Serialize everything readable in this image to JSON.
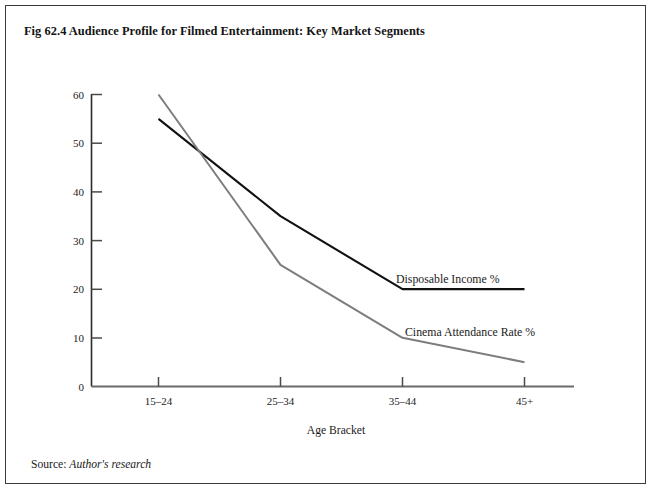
{
  "figure": {
    "title": "Fig 62.4 Audience Profile for Filmed Entertainment: Key Market Segments",
    "source_label": "Source:",
    "source_value": "Author's research"
  },
  "chart_data": {
    "type": "line",
    "title": "Fig 62.4 Audience Profile for Filmed Entertainment: Key Market Segments",
    "categories": [
      "15–24",
      "25–34",
      "35–44",
      "45+"
    ],
    "series": [
      {
        "name": "Disposable Income %",
        "values": [
          55,
          35,
          20,
          20
        ],
        "color": "#111111",
        "label_x": 390,
        "label_y": 277
      },
      {
        "name": "Cinema Attendance Rate %",
        "values": [
          60,
          25,
          10,
          5
        ],
        "color": "#7d7d7d",
        "label_x": 399,
        "label_y": 330
      }
    ],
    "xlabel": "Age Bracket",
    "ylabel": "",
    "ylim": [
      0,
      60
    ],
    "yticks": [
      0,
      10,
      20,
      30,
      40,
      50,
      60
    ],
    "ytick_labels": [
      "0",
      "10",
      "20",
      "30",
      "40",
      "50",
      "60"
    ],
    "grid": false,
    "legend": "inline-labels"
  },
  "axes": {
    "x_axis_label": "Age Bracket",
    "x_tick_labels": [
      "15–24",
      "25–34",
      "35–44",
      "45+"
    ],
    "y_tick_labels": [
      "60",
      "50",
      "40",
      "30",
      "20",
      "10",
      "0"
    ]
  }
}
